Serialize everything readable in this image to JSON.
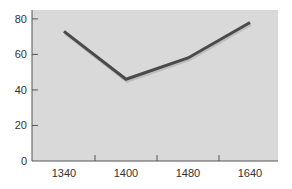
{
  "chart_data": {
    "type": "line",
    "title": "",
    "xlabel": "",
    "ylabel": "",
    "categories": [
      "1340",
      "1400",
      "1480",
      "1640"
    ],
    "series": [
      {
        "name": "series-1",
        "values": [
          73,
          46,
          58,
          78
        ]
      }
    ],
    "ylim": [
      0,
      85
    ],
    "yticks": [
      0,
      20,
      40,
      60,
      80
    ],
    "ytick_labels": [
      "0",
      "20",
      "40",
      "60",
      "80"
    ],
    "xtick_labels": [
      "1340",
      "1400",
      "1480",
      "1640"
    ],
    "grid": false,
    "legend": "none",
    "colors": {
      "plot_background": "#d9d9d9",
      "line": "#4a4a4a",
      "axis": "#555555",
      "text": "#333333"
    }
  }
}
